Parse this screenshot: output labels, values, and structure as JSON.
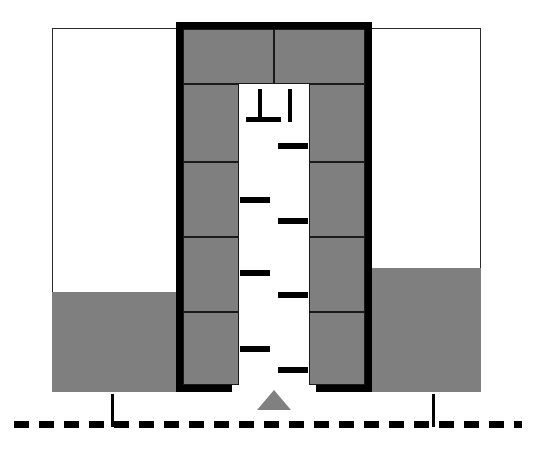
{
  "figure": {
    "type": "technical-cross-section",
    "canvas": {
      "width": 533,
      "height": 457
    },
    "colors": {
      "soil_fill": "#7f7f7f",
      "outline": "#2b2b2b",
      "heavy_frame": "#000000",
      "panel_fill": "#7f7f7f",
      "panel_outline": "#1a1a1a",
      "channel_fill": "#ffffff",
      "marker_gray": "#808080",
      "background": "#ffffff"
    }
  },
  "ground": {
    "left": {
      "box": {
        "x": 52,
        "y": 28,
        "w": 128,
        "h": 364
      },
      "air_region": {
        "x": 52,
        "y": 28,
        "w": 128,
        "h": 264
      },
      "soil_region": {
        "x": 52,
        "y": 292,
        "w": 128,
        "h": 100
      }
    },
    "right": {
      "box": {
        "x": 368,
        "y": 28,
        "w": 113,
        "h": 364
      },
      "air_region": {
        "x": 368,
        "y": 28,
        "w": 113,
        "h": 240
      },
      "soil_region": {
        "x": 368,
        "y": 268,
        "w": 113,
        "h": 124
      }
    }
  },
  "frame": {
    "label": "heavy black shoring outline",
    "thickness": 7,
    "top": {
      "x": 176,
      "y": 22,
      "w": 196,
      "h": 7
    },
    "left": {
      "x": 176,
      "y": 22,
      "w": 7,
      "h": 370
    },
    "right": {
      "x": 365,
      "y": 22,
      "w": 7,
      "h": 370
    },
    "foot_left": {
      "x": 176,
      "y": 385,
      "w": 56,
      "h": 7
    },
    "foot_right": {
      "x": 316,
      "y": 385,
      "w": 56,
      "h": 7
    }
  },
  "top_band": {
    "label": "upper capping beam, two segments",
    "segments": [
      {
        "name": "top-band-left",
        "x": 183,
        "y": 29,
        "w": 91,
        "h": 55
      },
      {
        "name": "top-band-right",
        "x": 274,
        "y": 29,
        "w": 91,
        "h": 55
      }
    ]
  },
  "left_wall_panels": [
    {
      "index": 1,
      "x": 183,
      "y": 84,
      "w": 56,
      "h": 78
    },
    {
      "index": 2,
      "x": 183,
      "y": 162,
      "w": 56,
      "h": 75
    },
    {
      "index": 3,
      "x": 183,
      "y": 237,
      "w": 56,
      "h": 75
    },
    {
      "index": 4,
      "x": 183,
      "y": 312,
      "w": 56,
      "h": 73
    }
  ],
  "right_wall_panels": [
    {
      "index": 1,
      "x": 309,
      "y": 84,
      "w": 56,
      "h": 78
    },
    {
      "index": 2,
      "x": 309,
      "y": 162,
      "w": 56,
      "h": 75
    },
    {
      "index": 3,
      "x": 309,
      "y": 237,
      "w": 56,
      "h": 75
    },
    {
      "index": 4,
      "x": 309,
      "y": 312,
      "w": 56,
      "h": 73
    }
  ],
  "channel": {
    "label": "open trench void between walls",
    "x": 239,
    "y": 84,
    "w": 70,
    "h": 308
  },
  "marks": {
    "label": "ladder / scale strokes inside the trench",
    "stem": {
      "name": "tee-stem",
      "x": 258,
      "y": 89,
      "w": 4,
      "h": 30
    },
    "stem_base": {
      "name": "tee-base",
      "x": 246,
      "y": 117,
      "w": 35,
      "h": 5
    },
    "vertical_bar": {
      "name": "vertical-bar",
      "x": 288,
      "y": 89,
      "w": 4,
      "h": 33
    },
    "rungs": [
      {
        "side": "right",
        "x": 278,
        "y": 143,
        "w": 30,
        "h": 6
      },
      {
        "side": "left",
        "x": 240,
        "y": 197,
        "w": 30,
        "h": 6
      },
      {
        "side": "right",
        "x": 278,
        "y": 218,
        "w": 30,
        "h": 6
      },
      {
        "side": "left",
        "x": 240,
        "y": 270,
        "w": 30,
        "h": 6
      },
      {
        "side": "right",
        "x": 278,
        "y": 292,
        "w": 30,
        "h": 6
      },
      {
        "side": "left",
        "x": 240,
        "y": 346,
        "w": 30,
        "h": 6
      },
      {
        "side": "right",
        "x": 278,
        "y": 367,
        "w": 30,
        "h": 6
      }
    ]
  },
  "triangle_marker": {
    "label": "invert level indicator",
    "x": 257,
    "y": 390
  },
  "grade_line": {
    "label": "dashed grade / reference datum line",
    "x": 14,
    "y": 421,
    "w": 508,
    "h": 7,
    "dash_length": 15,
    "gap_length": 10
  },
  "dimension_ticks": [
    {
      "name": "dimension-tick-left",
      "x": 111,
      "y": 394,
      "w": 3,
      "h": 33
    },
    {
      "name": "dimension-tick-right",
      "x": 432,
      "y": 394,
      "w": 3,
      "h": 33
    }
  ]
}
